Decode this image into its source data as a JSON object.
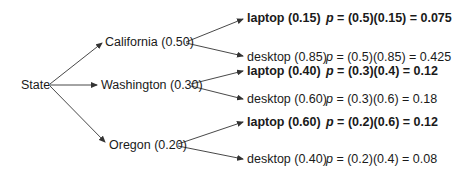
{
  "diagram": {
    "type": "probability-tree",
    "root": {
      "label": "State"
    },
    "states": [
      {
        "label": "California (0.50)",
        "name": "California",
        "prob": 0.5,
        "children": [
          {
            "label": "laptop (0.15)",
            "bold": true,
            "p_symbol": "p",
            "formula": " = (0.5)(0.15) = 0.075"
          },
          {
            "label": "desktop (0.85)",
            "bold": false,
            "p_symbol": "p",
            "formula": " = (0.5)(0.85) = 0.425"
          }
        ]
      },
      {
        "label": "Washington (0.30)",
        "name": "Washington",
        "prob": 0.3,
        "children": [
          {
            "label": "laptop (0.40)",
            "bold": true,
            "p_symbol": "p",
            "formula": " = (0.3)(0.4) = 0.12"
          },
          {
            "label": "desktop (0.60)",
            "bold": false,
            "p_symbol": "p",
            "formula": " = (0.3)(0.6) = 0.18"
          }
        ]
      },
      {
        "label": "Oregon (0.20)",
        "name": "Oregon",
        "prob": 0.2,
        "children": [
          {
            "label": "laptop (0.60)",
            "bold": true,
            "p_symbol": "p",
            "formula": " = (0.2)(0.6) = 0.12"
          },
          {
            "label": "desktop (0.40)",
            "bold": false,
            "p_symbol": "p",
            "formula": " = (0.2)(0.4) = 0.08"
          }
        ]
      }
    ],
    "colors": {
      "line": "#333333",
      "text": "#1a1a1a"
    }
  }
}
